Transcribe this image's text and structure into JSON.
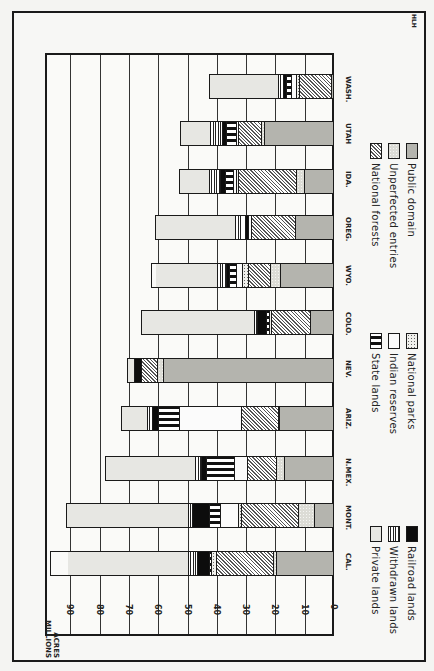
{
  "chart_data": {
    "type": "bar",
    "orientation": "horizontal-stacked (figure printed rotated 90° clockwise)",
    "title": "",
    "credit": "HLH",
    "ylabel": "ACRES MILLIONS",
    "axis_ticks": [
      "0",
      "10",
      "20",
      "30",
      "40",
      "50",
      "60",
      "70",
      "80",
      "90"
    ],
    "axis_range": [
      0,
      100
    ],
    "grid": true,
    "categories": [
      "CAL.",
      "MONT.",
      "N.MEX.",
      "ARIZ.",
      "NEV.",
      "COLO.",
      "WYO.",
      "OREG.",
      "IDA.",
      "UTAH",
      "WASH."
    ],
    "series_order_from_baseline": [
      "Public domain",
      "Unperfected entries",
      "National forests",
      "National parks",
      "Indian reserves",
      "State lands",
      "Railroad lands",
      "Withdrawn lands",
      "Private lands"
    ],
    "series": [
      {
        "name": "Public domain",
        "pattern": "p-public",
        "values": [
          19.5,
          6.5,
          16.7,
          18.4,
          58.0,
          8.0,
          18.0,
          13.0,
          10.0,
          23.5,
          0.7
        ]
      },
      {
        "name": "Unperfected entries",
        "pattern": "p-unperf",
        "values": [
          1.1,
          5.5,
          2.9,
          0.3,
          2.0,
          0.0,
          3.5,
          0.0,
          2.5,
          1.0,
          0.0
        ]
      },
      {
        "name": "National forests",
        "pattern": "p-forest",
        "values": [
          19.4,
          19.5,
          9.9,
          12.8,
          5.5,
          13.0,
          7.5,
          15.0,
          20.0,
          8.0,
          11.0
        ]
      },
      {
        "name": "National parks",
        "pattern": "p-parks",
        "values": [
          1.5,
          1.0,
          0.0,
          0.0,
          0.0,
          1.0,
          2.0,
          0.0,
          0.5,
          0.0,
          1.0
        ]
      },
      {
        "name": "Indian reserves",
        "pattern": "p-indian",
        "values": [
          0.0,
          6.0,
          4.2,
          21.1,
          0.0,
          0.0,
          2.0,
          1.0,
          1.0,
          0.5,
          1.5
        ]
      },
      {
        "name": "State lands",
        "pattern": "p-state",
        "values": [
          1.0,
          4.0,
          9.5,
          7.0,
          0.0,
          1.0,
          2.5,
          0.0,
          3.0,
          3.5,
          2.0
        ]
      },
      {
        "name": "Railroad lands",
        "pattern": "p-railroad",
        "values": [
          4.0,
          5.5,
          2.0,
          2.3,
          2.5,
          3.0,
          1.0,
          1.0,
          1.5,
          1.5,
          1.0
        ]
      },
      {
        "name": "Withdrawn lands",
        "pattern": "p-withdrawn",
        "values": [
          3.0,
          1.5,
          2.0,
          1.5,
          0.0,
          1.0,
          3.0,
          3.5,
          4.0,
          4.0,
          1.5
        ]
      },
      {
        "name": "Private lands",
        "pattern": "p-private",
        "values": [
          41.0,
          42.5,
          30.5,
          9.4,
          4.5,
          39.0,
          21.0,
          27.5,
          10.5,
          10.5,
          24.0
        ]
      }
    ],
    "totals": [
      97.0,
      91.5,
      78.0,
      72.8,
      70.5,
      66.0,
      62.5,
      61.0,
      53.0,
      52.5,
      42.7
    ],
    "legend": [
      {
        "label": "Private lands",
        "pattern": "p-private"
      },
      {
        "label": "Withdrawn lands",
        "pattern": "p-withdrawn"
      },
      {
        "label": "Railroad lands",
        "pattern": "p-railroad"
      },
      {
        "label": "State lands",
        "pattern": "p-state"
      },
      {
        "label": "Indian reserves",
        "pattern": "p-indian"
      },
      {
        "label": "National parks",
        "pattern": "p-parks"
      },
      {
        "label": "National forests",
        "pattern": "p-forest"
      },
      {
        "label": "Unperfected entries",
        "pattern": "p-unperf"
      },
      {
        "label": "Public domain",
        "pattern": "p-public"
      }
    ]
  },
  "labels": {
    "credit": "HLH",
    "axis_title": "ACRES\nMILLIONS"
  }
}
